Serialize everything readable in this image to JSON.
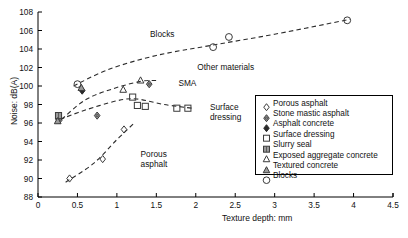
{
  "chart_data": {
    "type": "scatter",
    "title": "",
    "xlabel": "Texture depth: mm",
    "ylabel": "Noise: dB(A)",
    "xlim": [
      0,
      4.5
    ],
    "ylim": [
      88,
      108
    ],
    "xticks": [
      "0",
      "0.5",
      "1",
      "1.5",
      "2",
      "2.5",
      "3",
      "3.5",
      "4",
      "4.5"
    ],
    "xtick_values": [
      0,
      0.5,
      1,
      1.5,
      2,
      2.5,
      3,
      3.5,
      4,
      4.5
    ],
    "yticks": [
      "88",
      "90",
      "92",
      "94",
      "96",
      "98",
      "100",
      "102",
      "104",
      "106",
      "108"
    ],
    "ytick_values": [
      88,
      90,
      92,
      94,
      96,
      98,
      100,
      102,
      104,
      106,
      108
    ],
    "grid": false,
    "legend_position": "right",
    "legend": [
      {
        "label": "Porous asphalt",
        "marker": "diamond-open"
      },
      {
        "label": "Stone mastic asphalt",
        "marker": "diamond-grey"
      },
      {
        "label": "Asphalt concrete",
        "marker": "diamond-filled"
      },
      {
        "label": "Surface dressing",
        "marker": "square-open"
      },
      {
        "label": "Slurry seal",
        "marker": "square-grey"
      },
      {
        "label": "Exposed aggregate concrete",
        "marker": "triangle-open"
      },
      {
        "label": "Textured concrete",
        "marker": "triangle-grey"
      },
      {
        "label": "Blocks",
        "marker": "circle-open"
      }
    ],
    "series": [
      {
        "name": "Porous asphalt",
        "marker": "diamond-open",
        "points": [
          [
            0.4,
            90.0
          ],
          [
            0.82,
            92.1
          ],
          [
            1.09,
            95.3
          ],
          [
            0.26,
            96.4
          ]
        ]
      },
      {
        "name": "Stone mastic asphalt",
        "marker": "diamond-grey",
        "points": [
          [
            0.27,
            96.3
          ],
          [
            0.75,
            96.8
          ],
          [
            1.41,
            100.2
          ]
        ]
      },
      {
        "name": "Asphalt concrete",
        "marker": "diamond-filled",
        "points": [
          [
            0.56,
            99.5
          ]
        ]
      },
      {
        "name": "Surface dressing",
        "marker": "square-open",
        "points": [
          [
            1.2,
            98.8
          ],
          [
            1.26,
            97.9
          ],
          [
            1.36,
            97.8
          ],
          [
            1.76,
            97.6
          ],
          [
            1.9,
            97.6
          ]
        ]
      },
      {
        "name": "Slurry seal",
        "marker": "square-grey",
        "points": [
          [
            0.26,
            96.8
          ]
        ]
      },
      {
        "name": "Exposed aggregate concrete",
        "marker": "triangle-open",
        "points": [
          [
            1.08,
            99.6
          ],
          [
            1.3,
            100.6
          ]
        ]
      },
      {
        "name": "Textured concrete",
        "marker": "triangle-grey",
        "points": [
          [
            0.25,
            96.2
          ],
          [
            0.55,
            99.8
          ]
        ]
      },
      {
        "name": "Blocks",
        "marker": "circle-open",
        "points": [
          [
            0.5,
            100.2
          ],
          [
            2.22,
            104.2
          ],
          [
            2.42,
            105.3
          ],
          [
            3.92,
            107.1
          ]
        ]
      }
    ],
    "trend_lines": [
      {
        "name": "Blocks",
        "style": "dashed",
        "path": [
          [
            0.45,
            100.0
          ],
          [
            0.9,
            101.8
          ],
          [
            1.5,
            103.3
          ],
          [
            2.2,
            104.4
          ],
          [
            3.0,
            105.6
          ],
          [
            3.95,
            107.2
          ]
        ]
      },
      {
        "name": "Other materials",
        "style": "dashed",
        "path": [
          [
            0.3,
            96.4
          ],
          [
            0.6,
            98.5
          ],
          [
            0.95,
            99.7
          ],
          [
            1.3,
            100.5
          ],
          [
            1.5,
            100.6
          ]
        ]
      },
      {
        "name": "Surface dressing",
        "style": "dashed",
        "path": [
          [
            0.28,
            96.4
          ],
          [
            0.6,
            97.4
          ],
          [
            1.0,
            98.4
          ],
          [
            1.25,
            98.6
          ],
          [
            1.6,
            98.0
          ],
          [
            1.95,
            97.6
          ]
        ]
      },
      {
        "name": "Porous asphalt",
        "style": "dashed",
        "path": [
          [
            0.35,
            89.6
          ],
          [
            0.7,
            91.6
          ],
          [
            1.0,
            94.2
          ],
          [
            1.22,
            96.0
          ]
        ]
      }
    ],
    "annotations": [
      {
        "text": "Blocks",
        "x": 1.42,
        "y": 105.5
      },
      {
        "text": "Other materials",
        "x": 2.02,
        "y": 101.9
      },
      {
        "text": "SMA",
        "x": 1.78,
        "y": 100.2
      },
      {
        "text": "Surface dressing",
        "x": 2.18,
        "y": 97.6,
        "lines": [
          "Surface",
          "dressing"
        ]
      },
      {
        "text": "Porous asphalt",
        "x": 1.3,
        "y": 92.5,
        "lines": [
          "Porous",
          "asphalt"
        ]
      }
    ]
  },
  "colors": {
    "axis": "#000000",
    "marker_stroke": "#3a3a3a",
    "marker_grey": "#9a9a9a",
    "marker_dark": "#2a2a2a",
    "trend": "#2b2b2b",
    "background": "#ffffff"
  }
}
